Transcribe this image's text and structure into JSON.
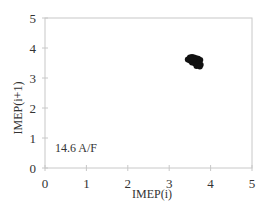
{
  "chart_data": {
    "type": "scatter",
    "title": "",
    "xlabel": "IMEP(i)",
    "ylabel": "IMEP(i+1)",
    "xlim": [
      0,
      5
    ],
    "ylim": [
      0,
      5
    ],
    "xticks": [
      "0",
      "1",
      "2",
      "3",
      "4",
      "5"
    ],
    "yticks": [
      "0",
      "1",
      "2",
      "3",
      "4",
      "5"
    ],
    "grid": false,
    "legend": null,
    "annotations": [
      {
        "text": "14.6 A/F",
        "x": 0.2,
        "y": 0.9
      }
    ],
    "series": [
      {
        "name": "14.6 A/F",
        "color": "#111111",
        "points": [
          [
            3.45,
            3.62
          ],
          [
            3.5,
            3.68
          ],
          [
            3.55,
            3.7
          ],
          [
            3.6,
            3.68
          ],
          [
            3.65,
            3.66
          ],
          [
            3.7,
            3.64
          ],
          [
            3.75,
            3.6
          ],
          [
            3.5,
            3.58
          ],
          [
            3.58,
            3.6
          ],
          [
            3.62,
            3.55
          ],
          [
            3.68,
            3.52
          ],
          [
            3.72,
            3.5
          ],
          [
            3.55,
            3.52
          ],
          [
            3.62,
            3.48
          ],
          [
            3.7,
            3.45
          ],
          [
            3.76,
            3.44
          ],
          [
            3.66,
            3.4
          ],
          [
            3.74,
            3.38
          ],
          [
            3.6,
            3.62
          ],
          [
            3.53,
            3.64
          ]
        ]
      }
    ]
  },
  "colors": {
    "axis": "#c8c8c8",
    "marker": "#111111",
    "text": "#333333"
  }
}
